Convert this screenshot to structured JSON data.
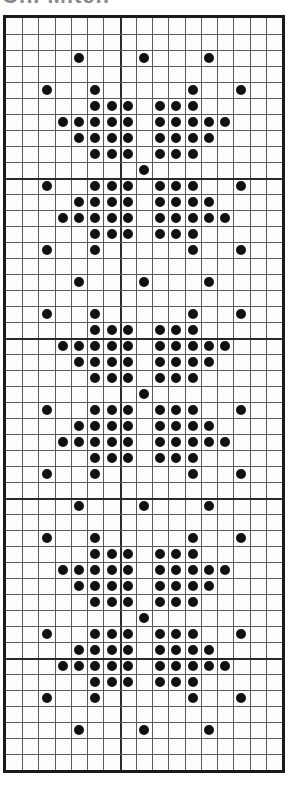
{
  "title": "Ch. Mitch",
  "chart": {
    "kind": "knitting-stitch-chart",
    "columns": 17,
    "rows": 47,
    "thick_line_every": 10,
    "thick_vertical_at_col": 7,
    "thick_horizontal_at_rows": [
      10,
      20,
      30,
      40
    ],
    "symbol": "filled-dot",
    "colors": {
      "ink": "#111111",
      "grid": "#5a5a5a",
      "border": "#1a1a1a",
      "paper": "#fdfdfd"
    },
    "repeat_period_rows": 14,
    "rows_with_dots": [
      {
        "row": 2,
        "cols": [
          4,
          8,
          12
        ]
      },
      {
        "row": 4,
        "cols": [
          2,
          5,
          11,
          14
        ]
      },
      {
        "row": 5,
        "cols": [
          5,
          6,
          7,
          9,
          10,
          11
        ]
      },
      {
        "row": 6,
        "cols": [
          3,
          4,
          5,
          6,
          7,
          9,
          10,
          11,
          12,
          13
        ]
      },
      {
        "row": 7,
        "cols": [
          4,
          5,
          6,
          7,
          9,
          10,
          11,
          12
        ]
      },
      {
        "row": 8,
        "cols": [
          5,
          6,
          7,
          9,
          10,
          11
        ]
      },
      {
        "row": 9,
        "cols": [
          8
        ]
      },
      {
        "row": 10,
        "cols": [
          2,
          5,
          6,
          7,
          9,
          10,
          11,
          14
        ]
      },
      {
        "row": 11,
        "cols": [
          4,
          5,
          6,
          7,
          9,
          10,
          11,
          12
        ]
      },
      {
        "row": 12,
        "cols": [
          3,
          4,
          5,
          6,
          7,
          9,
          10,
          11,
          12,
          13
        ]
      },
      {
        "row": 13,
        "cols": [
          5,
          6,
          7,
          9,
          10,
          11
        ]
      },
      {
        "row": 14,
        "cols": [
          2,
          5,
          11,
          14
        ]
      },
      {
        "row": 16,
        "cols": [
          4,
          8,
          12
        ]
      },
      {
        "row": 18,
        "cols": [
          2,
          5,
          11,
          14
        ]
      },
      {
        "row": 19,
        "cols": [
          5,
          6,
          7,
          9,
          10,
          11
        ]
      },
      {
        "row": 20,
        "cols": [
          3,
          4,
          5,
          6,
          7,
          9,
          10,
          11,
          12,
          13
        ]
      },
      {
        "row": 21,
        "cols": [
          4,
          5,
          6,
          7,
          9,
          10,
          11,
          12
        ]
      },
      {
        "row": 22,
        "cols": [
          5,
          6,
          7,
          9,
          10,
          11
        ]
      },
      {
        "row": 23,
        "cols": [
          8
        ]
      },
      {
        "row": 24,
        "cols": [
          2,
          5,
          6,
          7,
          9,
          10,
          11,
          14
        ]
      },
      {
        "row": 25,
        "cols": [
          4,
          5,
          6,
          7,
          9,
          10,
          11,
          12
        ]
      },
      {
        "row": 26,
        "cols": [
          3,
          4,
          5,
          6,
          7,
          9,
          10,
          11,
          12,
          13
        ]
      },
      {
        "row": 27,
        "cols": [
          5,
          6,
          7,
          9,
          10,
          11
        ]
      },
      {
        "row": 28,
        "cols": [
          2,
          5,
          11,
          14
        ]
      },
      {
        "row": 30,
        "cols": [
          4,
          8,
          12
        ]
      },
      {
        "row": 32,
        "cols": [
          2,
          5,
          11,
          14
        ]
      },
      {
        "row": 33,
        "cols": [
          5,
          6,
          7,
          9,
          10,
          11
        ]
      },
      {
        "row": 34,
        "cols": [
          3,
          4,
          5,
          6,
          7,
          9,
          10,
          11,
          12,
          13
        ]
      },
      {
        "row": 35,
        "cols": [
          4,
          5,
          6,
          7,
          9,
          10,
          11,
          12
        ]
      },
      {
        "row": 36,
        "cols": [
          5,
          6,
          7,
          9,
          10,
          11
        ]
      },
      {
        "row": 37,
        "cols": [
          8
        ]
      },
      {
        "row": 38,
        "cols": [
          2,
          5,
          6,
          7,
          9,
          10,
          11,
          14
        ]
      },
      {
        "row": 39,
        "cols": [
          4,
          5,
          6,
          7,
          9,
          10,
          11,
          12
        ]
      },
      {
        "row": 40,
        "cols": [
          3,
          4,
          5,
          6,
          7,
          9,
          10,
          11,
          12,
          13
        ]
      },
      {
        "row": 41,
        "cols": [
          5,
          6,
          7,
          9,
          10,
          11
        ]
      },
      {
        "row": 42,
        "cols": [
          2,
          5,
          11,
          14
        ]
      },
      {
        "row": 44,
        "cols": [
          4,
          8,
          12
        ]
      }
    ]
  }
}
